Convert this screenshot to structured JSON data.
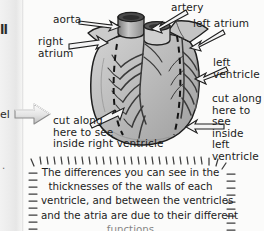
{
  "page": {
    "background_color": "#fbfbfa",
    "gutter_color": "#ececec"
  },
  "margin_fragments": {
    "top_clip": "ll",
    "mid_clip": "el",
    "low_clip": "."
  },
  "diagram": {
    "fill_color": "#b8b8b8",
    "outline_color": "#222222",
    "labels": [
      {
        "id": "aorta",
        "text": "aorta"
      },
      {
        "id": "artery",
        "text": "artery"
      },
      {
        "id": "left-atrium",
        "text": "left atrium"
      },
      {
        "id": "right-atrium",
        "text": "right\natrium"
      },
      {
        "id": "left-ventricle",
        "text": "left\nventricle"
      },
      {
        "id": "cut-right-ventricle",
        "text": "cut along\nhere to see\ninside right ventricle"
      },
      {
        "id": "cut-left-ventricle",
        "text": "cut along\nhere to see\ninside left\nventricle"
      }
    ]
  },
  "caption": {
    "lines": [
      "The differences you can see in the",
      "thicknesses of the walls of each",
      "ventricle, and between the ventricles",
      "and the atria are due to their different"
    ],
    "partial_line": "functions"
  }
}
